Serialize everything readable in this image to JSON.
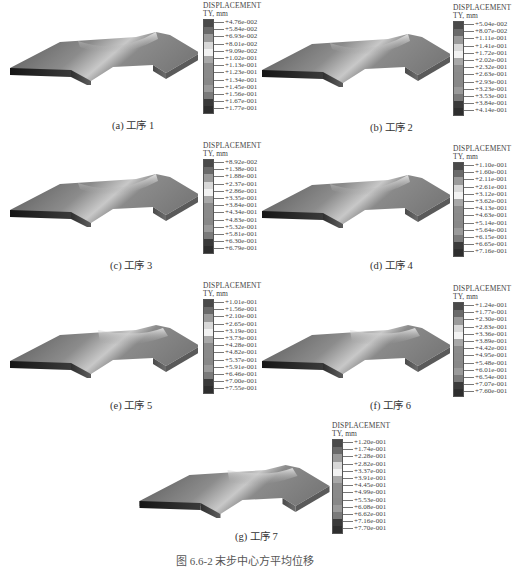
{
  "figure": {
    "caption_partial": "图 6.6-2  末步中心方平均位移"
  },
  "legend_common": {
    "title_line1": "DISPLACEMENT",
    "title_line2": "TY, mm",
    "colors": [
      "#4a4a4a",
      "#6a6a6a",
      "#9a9a9a",
      "#d8d8d8",
      "#f2f2f2",
      "#a8a8a8",
      "#8c8c8c",
      "#8a8a8a",
      "#888888",
      "#9a9a9a",
      "#7a7a7a",
      "#3a3a3a",
      "#2e2e2e"
    ]
  },
  "panels": [
    {
      "id": "a",
      "caption": "(a) 工序 1",
      "values": [
        "+4.76e-002",
        "+5.84e-002",
        "+6.93e-002",
        "+8.01e-002",
        "+9.09e-002",
        "+1.02e-001",
        "+1.13e-001",
        "+1.23e-001",
        "+1.34e-001",
        "+1.45e-001",
        "+1.56e-001",
        "+1.67e-001",
        "+1.77e-001"
      ]
    },
    {
      "id": "b",
      "caption": "(b) 工序 2",
      "values": [
        "+5.04e-002",
        "+8.07e-002",
        "+1.11e-001",
        "+1.41e-001",
        "+1.72e-001",
        "+2.02e-001",
        "+2.32e-001",
        "+2.63e-001",
        "+2.93e-001",
        "+3.23e-001",
        "+3.53e-001",
        "+3.84e-001",
        "+4.14e-001"
      ]
    },
    {
      "id": "c",
      "caption": "(c) 工序 3",
      "values": [
        "+8.92e-002",
        "+1.38e-001",
        "+1.88e-001",
        "+2.37e-001",
        "+2.86e-001",
        "+3.35e-001",
        "+3.84e-001",
        "+4.34e-001",
        "+4.83e-001",
        "+5.32e-001",
        "+5.81e-001",
        "+6.30e-001",
        "+6.79e-001"
      ]
    },
    {
      "id": "d",
      "caption": "(d) 工序 4",
      "values": [
        "+1.10e-001",
        "+1.60e-001",
        "+2.11e-001",
        "+2.61e-001",
        "+3.12e-001",
        "+3.62e-001",
        "+4.13e-001",
        "+4.63e-001",
        "+5.14e-001",
        "+5.64e-001",
        "+6.15e-001",
        "+6.65e-001",
        "+7.16e-001"
      ]
    },
    {
      "id": "e",
      "caption": "(e) 工序 5",
      "values": [
        "+1.01e-001",
        "+1.56e-001",
        "+2.10e-001",
        "+2.65e-001",
        "+3.19e-001",
        "+3.73e-001",
        "+4.28e-001",
        "+4.82e-001",
        "+5.37e-001",
        "+5.91e-001",
        "+6.46e-001",
        "+7.00e-001",
        "+7.55e-001"
      ]
    },
    {
      "id": "f",
      "caption": "(f) 工序 6",
      "values": [
        "+1.24e-001",
        "+1.77e-001",
        "+2.30e-001",
        "+2.83e-001",
        "+3.36e-001",
        "+3.89e-001",
        "+4.42e-001",
        "+4.95e-001",
        "+5.48e-001",
        "+6.01e-001",
        "+6.54e-001",
        "+7.07e-001",
        "+7.60e-001"
      ]
    },
    {
      "id": "g",
      "caption": "(g) 工序 7",
      "values": [
        "+1.20e-001",
        "+1.74e-001",
        "+2.28e-001",
        "+2.82e-001",
        "+3.37e-001",
        "+3.91e-001",
        "+4.45e-001",
        "+4.99e-001",
        "+5.53e-001",
        "+6.08e-001",
        "+6.62e-001",
        "+7.16e-001",
        "+7.70e-001"
      ]
    }
  ]
}
